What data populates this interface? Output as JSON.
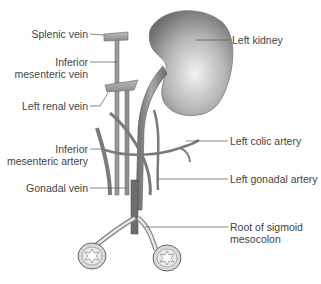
{
  "diagram": {
    "structures": {
      "kidney": "Left kidney",
      "ureter": "Ureter",
      "splenic_vein": "Splenic vein",
      "imv": "Inferior mesenteric vein",
      "renal_vein": "Left renal vein",
      "ima": "Inferior mesenteric artery",
      "gonadal_vein": "Gonadal vein",
      "left_colic": "Left colic artery",
      "gonadal_artery": "Left gonadal artery",
      "sigmoid_root": "Root of sigmoid mesocolon"
    },
    "colors": {
      "vessel_fill": "#8a8a8a",
      "vessel_stroke": "#555555",
      "kidney_light": "#e6e6e6",
      "kidney_dark": "#7a7a7a",
      "leader": "#555555",
      "text": "#444444"
    }
  },
  "labels": {
    "left": [
      {
        "id": "splenic_vein",
        "lines": [
          "Splenic vein"
        ]
      },
      {
        "id": "imv",
        "lines": [
          "Inferior",
          "mesenteric vein"
        ]
      },
      {
        "id": "renal_vein",
        "lines": [
          "Left renal vein"
        ]
      },
      {
        "id": "ima",
        "lines": [
          "Inferior",
          "mesenteric artery"
        ]
      },
      {
        "id": "gonadal_vein",
        "lines": [
          "Gonadal vein"
        ]
      }
    ],
    "right": [
      {
        "id": "kidney",
        "lines": [
          "Left kidney"
        ]
      },
      {
        "id": "left_colic",
        "lines": [
          "Left colic artery"
        ]
      },
      {
        "id": "gonadal_artery",
        "lines": [
          "Left gonadal artery"
        ]
      },
      {
        "id": "sigmoid_root",
        "lines": [
          "Root of sigmoid",
          "mesocolon"
        ]
      }
    ]
  }
}
